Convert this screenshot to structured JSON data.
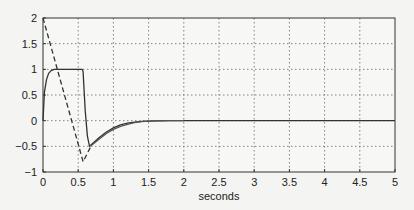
{
  "chart_data": {
    "type": "line",
    "title": "",
    "xlabel": "seconds",
    "ylabel": "",
    "xlim": [
      0,
      5
    ],
    "ylim": [
      -1,
      2
    ],
    "xticks": [
      0,
      0.5,
      1,
      1.5,
      2,
      2.5,
      3,
      3.5,
      4,
      4.5,
      5
    ],
    "xtick_labels": [
      "0",
      "0.5",
      "1",
      "1.5",
      "2",
      "2.5",
      "3",
      "3.5",
      "4",
      "4.5",
      "5"
    ],
    "yticks": [
      -1,
      -0.5,
      0,
      0.5,
      1,
      1.5,
      2
    ],
    "ytick_labels": [
      "−1",
      "−0.5",
      "0",
      "0.5",
      "1",
      "1.5",
      "2"
    ],
    "grid": true,
    "legend": null,
    "series": [
      {
        "name": "solid-1",
        "style": "solid",
        "color": "#333333",
        "x": [
          0,
          0.02,
          0.05,
          0.08,
          0.12,
          0.16,
          0.2,
          0.3,
          0.4,
          0.5,
          0.56,
          0.57,
          0.6,
          0.63,
          0.66,
          0.7,
          0.8,
          0.9,
          1.0,
          1.1,
          1.2,
          1.3,
          1.4,
          1.5,
          1.6,
          1.8,
          2.0,
          3.0,
          4.0,
          5.0
        ],
        "y": [
          0,
          0.55,
          0.8,
          0.92,
          0.98,
          1.0,
          1.0,
          1.0,
          1.0,
          1.0,
          1.0,
          0.95,
          0.2,
          -0.3,
          -0.5,
          -0.45,
          -0.33,
          -0.22,
          -0.14,
          -0.08,
          -0.05,
          -0.03,
          -0.015,
          -0.008,
          -0.004,
          -0.001,
          0,
          0,
          0,
          0
        ]
      },
      {
        "name": "solid-2",
        "style": "solid",
        "color": "#555555",
        "x": [
          0.66,
          0.7,
          0.8,
          0.9,
          1.0,
          1.1,
          1.2,
          1.3,
          1.4,
          1.5,
          1.6,
          1.8,
          2.0
        ],
        "y": [
          -0.5,
          -0.47,
          -0.36,
          -0.25,
          -0.17,
          -0.11,
          -0.07,
          -0.04,
          -0.02,
          -0.01,
          -0.005,
          -0.001,
          0
        ]
      },
      {
        "name": "dashed",
        "style": "dashed",
        "color": "#333333",
        "x": [
          0,
          0.57,
          0.68
        ],
        "y": [
          2,
          -0.8,
          -0.5
        ]
      }
    ]
  }
}
